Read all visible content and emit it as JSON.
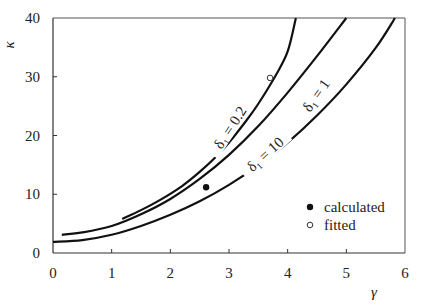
{
  "chart_data": {
    "type": "line",
    "title": "",
    "xlabel": "γ",
    "ylabel": "κ",
    "xlim": [
      0,
      6
    ],
    "ylim": [
      0,
      40
    ],
    "xticks": [
      "0",
      "1",
      "2",
      "3",
      "4",
      "5",
      "6"
    ],
    "yticks": [
      "0",
      "10",
      "20",
      "30",
      "40"
    ],
    "grid": false,
    "series": [
      {
        "name": "δ1 = 0.2",
        "label_text": "δ₁ = 0.2",
        "points": [
          [
            1.18,
            5.8
          ],
          [
            1.5,
            7.3
          ],
          [
            1.82,
            9.0
          ],
          [
            2.2,
            11.4
          ],
          [
            2.5,
            13.8
          ],
          [
            2.8,
            16.6
          ],
          [
            3.0,
            18.8
          ],
          [
            3.3,
            22.6
          ],
          [
            3.5,
            25.4
          ],
          [
            3.8,
            30.3
          ],
          [
            4.0,
            34.3
          ],
          [
            4.14,
            40
          ]
        ]
      },
      {
        "name": "δ1 = 1",
        "label_text": "δ₁ = 1",
        "points": [
          [
            0.15,
            3.1
          ],
          [
            0.5,
            3.5
          ],
          [
            1.0,
            4.6
          ],
          [
            1.5,
            6.6
          ],
          [
            2.0,
            9.2
          ],
          [
            2.5,
            12.6
          ],
          [
            3.0,
            16.7
          ],
          [
            3.5,
            21.6
          ],
          [
            4.0,
            27.3
          ],
          [
            4.5,
            33.5
          ],
          [
            5.0,
            40
          ]
        ]
      },
      {
        "name": "δ1 = 10",
        "label_text": "δ₁ = 10",
        "points": [
          [
            0,
            1.9
          ],
          [
            0.5,
            2.2
          ],
          [
            1.0,
            3.1
          ],
          [
            1.5,
            4.6
          ],
          [
            2.0,
            6.5
          ],
          [
            2.5,
            8.8
          ],
          [
            3.0,
            11.6
          ],
          [
            3.5,
            14.9
          ],
          [
            4.0,
            18.8
          ],
          [
            4.5,
            23.4
          ],
          [
            5.0,
            28.7
          ],
          [
            5.5,
            34.9
          ],
          [
            5.83,
            40
          ]
        ]
      }
    ],
    "markers": [
      {
        "name": "calculated",
        "style": "filled-circle",
        "x": 2.61,
        "y": 11.2
      },
      {
        "name": "fitted",
        "style": "open-circle",
        "x": 3.7,
        "y": 29.8
      }
    ],
    "legend": {
      "position": "lower-right-inside",
      "entries": [
        {
          "label": "calculated",
          "symbol": "filled-circle"
        },
        {
          "label": "fitted",
          "symbol": "open-circle"
        }
      ]
    }
  }
}
